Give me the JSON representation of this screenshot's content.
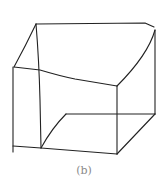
{
  "figure": {
    "caption": "(b)",
    "stroke_color": "#222222",
    "background": "#ffffff"
  }
}
